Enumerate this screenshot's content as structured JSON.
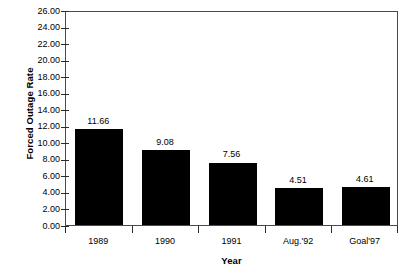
{
  "chart_data": {
    "type": "bar",
    "title": "",
    "xlabel": "Year",
    "ylabel": "Forced Outage Rate",
    "categories": [
      "1989",
      "1990",
      "1991",
      "Aug.'92",
      "Goal'97"
    ],
    "values": [
      11.66,
      9.08,
      7.56,
      4.51,
      4.61
    ],
    "value_labels": [
      "11.66",
      "9.08",
      "7.56",
      "4.51",
      "4.61"
    ],
    "ylim": [
      0,
      26
    ],
    "ytick_step": 2,
    "ytick_labels": [
      "26.00",
      "24.00",
      "22.00",
      "20.00",
      "18.00",
      "16.00",
      "14.00",
      "12.00",
      "10.00",
      "8.00",
      "6.00",
      "4.00",
      "2.00",
      "0.00"
    ],
    "ytick_values": [
      26,
      24,
      22,
      20,
      18,
      16,
      14,
      12,
      10,
      8,
      6,
      4,
      2,
      0
    ],
    "grid": false,
    "legend": false,
    "legend_position": "none",
    "bar_color": "#000000",
    "axis_color": "#4a4a4a",
    "background_color": "#ffffff",
    "text_color": "#000000"
  }
}
